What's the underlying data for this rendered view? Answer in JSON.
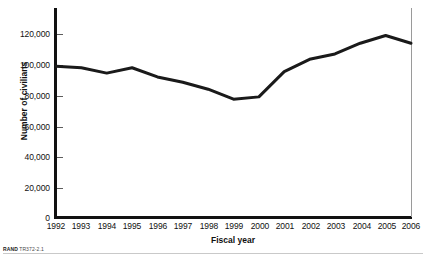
{
  "figure": {
    "footnote_prefix": "RAND",
    "footnote_id": "TR372-2.1"
  },
  "chart_data": {
    "type": "line",
    "title": "",
    "xlabel": "Fiscal year",
    "ylabel": "Number of civilians",
    "categories": [
      "1992",
      "1993",
      "1994",
      "1995",
      "1996",
      "1997",
      "1998",
      "1999",
      "2000",
      "2001",
      "2002",
      "2003",
      "2004",
      "2005",
      "2006"
    ],
    "values": [
      99000,
      98000,
      94500,
      98000,
      92000,
      88500,
      84000,
      77500,
      79000,
      95500,
      103500,
      107000,
      114000,
      119000,
      114000
    ],
    "series": [
      {
        "name": "Number of civilians",
        "values": [
          99000,
          98000,
          94500,
          98000,
          92000,
          88500,
          84000,
          77500,
          79000,
          95500,
          103500,
          107000,
          114000,
          119000,
          114000
        ],
        "color": "#1a1a1a"
      }
    ],
    "ylim": [
      0,
      130000
    ],
    "yticks": [
      0,
      20000,
      40000,
      60000,
      80000,
      100000,
      120000
    ],
    "ytick_labels": [
      "0",
      "20,000",
      "40,000",
      "60,000",
      "80,000",
      "100,000",
      "120,000"
    ],
    "xlim": [
      "1992",
      "2006"
    ],
    "grid": false,
    "legend": false,
    "legend_position": "none",
    "line_color": "#1a1a1a",
    "line_width": 3
  }
}
